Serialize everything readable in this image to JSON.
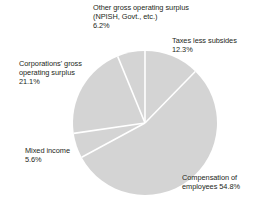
{
  "chart_data": {
    "type": "pie",
    "title": "",
    "subtitle": "",
    "xlabel": "",
    "ylabel": "",
    "legend": "none",
    "grid": false,
    "units": "percent",
    "total": 100.0,
    "start_angle_deg": 0,
    "direction": "clockwise",
    "categories": [
      "Taxes less subsides",
      "Compensation of employees",
      "Mixed income",
      "Corporations' gross operating surplus",
      "Other gross operating surplus (NPISH, Govt., etc.)"
    ],
    "values": [
      12.3,
      54.8,
      5.6,
      21.1,
      6.2
    ],
    "slices": [
      {
        "name": "taxes-less-subsides",
        "label_lines": [
          "Taxes less subsides",
          "12.3%"
        ],
        "value": 12.3,
        "value_text": "12.3%",
        "color": "#d4d4d4"
      },
      {
        "name": "compensation-of-employees",
        "label_lines": [
          "Compensation of",
          "employees 54.8%"
        ],
        "value": 54.8,
        "value_text": "54.8%",
        "color": "#d4d4d4"
      },
      {
        "name": "mixed-income",
        "label_lines": [
          "Mixed income",
          "5.6%"
        ],
        "value": 5.6,
        "value_text": "5.6%",
        "color": "#d4d4d4"
      },
      {
        "name": "corporations-gross-operating-surplus",
        "label_lines": [
          "Corporations' gross",
          "operating surplus",
          "21.1%"
        ],
        "value": 21.1,
        "value_text": "21.1%",
        "color": "#d4d4d4"
      },
      {
        "name": "other-gross-operating-surplus",
        "label_lines": [
          "Other gross operating surplus",
          "(NPISH, Govt., etc.)",
          "6.2%"
        ],
        "value": 6.2,
        "value_text": "6.2%",
        "color": "#d4d4d4"
      }
    ],
    "colors": {
      "slice_fill": "#d4d4d4",
      "separator": "#ffffff",
      "text": "#231f20",
      "background": "#ffffff"
    },
    "geometry": {
      "center_x": 145,
      "center_y": 123,
      "radius": 72
    }
  },
  "labels": {
    "other": {
      "line1": "Other gross operating surplus",
      "line2": "(NPISH, Govt., etc.)",
      "line3": "6.2%"
    },
    "taxes": {
      "line1": "Taxes less subsides",
      "line2": "12.3%"
    },
    "corporations": {
      "line1": "Corporations' gross",
      "line2": "operating surplus",
      "line3": "21.1%"
    },
    "mixed": {
      "line1": "Mixed income",
      "line2": "5.6%"
    },
    "compensation": {
      "line1": "Compensation of",
      "line2": "employees 54.8%"
    }
  }
}
